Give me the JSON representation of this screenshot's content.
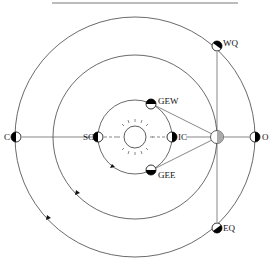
{
  "diagram": {
    "colors": {
      "line": "#555555",
      "orbit": "#444444",
      "planet_dark": "#000000",
      "planet_light": "#ffffff",
      "earth_fill": "#bbbbbb"
    },
    "sun": {
      "cx": 135,
      "cy": 137,
      "r": 11,
      "icon": "sun-icon"
    },
    "orbits": [
      {
        "name": "inner-planet-orbit",
        "r": 37
      },
      {
        "name": "earth-orbit",
        "r": 82
      },
      {
        "name": "outer-planet-orbit",
        "r": 120
      }
    ],
    "earth": {
      "cx": 217,
      "cy": 137,
      "r": 6
    },
    "labels": {
      "C": "C",
      "SC": "SC",
      "IC": "IC",
      "O": "O",
      "WQ": "WQ",
      "EQ": "EQ",
      "GEW": "GEW",
      "GEE": "GEE"
    },
    "positions": [
      {
        "key": "C",
        "label": "C",
        "meaning": "conjunction",
        "cx": 16,
        "cy": 137
      },
      {
        "key": "SC",
        "label": "SC",
        "meaning": "superior conjunction",
        "cx": 98,
        "cy": 137
      },
      {
        "key": "IC",
        "label": "IC",
        "meaning": "inferior conjunction",
        "cx": 172,
        "cy": 137
      },
      {
        "key": "O",
        "label": "O",
        "meaning": "opposition",
        "cx": 255,
        "cy": 137
      },
      {
        "key": "WQ",
        "label": "WQ",
        "meaning": "western quadrature",
        "cx": 217,
        "cy": 46
      },
      {
        "key": "EQ",
        "label": "EQ",
        "meaning": "eastern quadrature",
        "cx": 217,
        "cy": 228
      },
      {
        "key": "GEW",
        "label": "GEW",
        "meaning": "greatest elongation west",
        "cx": 151,
        "cy": 104
      },
      {
        "key": "GEE",
        "label": "GEE",
        "meaning": "greatest elongation east",
        "cx": 151,
        "cy": 170
      }
    ]
  }
}
